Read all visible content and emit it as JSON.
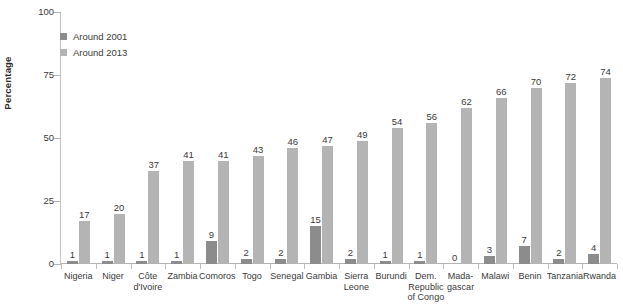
{
  "chart_data": {
    "type": "bar",
    "title": "",
    "xlabel": "",
    "ylabel": "Percentage",
    "ylim": [
      0,
      100
    ],
    "yticks": [
      0,
      25,
      50,
      75,
      100
    ],
    "grid": false,
    "legend_position": "top-left",
    "categories": [
      "Nigeria",
      "Niger",
      "Côte d'Ivoire",
      "Zambia",
      "Comoros",
      "Togo",
      "Senegal",
      "Gambia",
      "Sierra Leone",
      "Burundi",
      "Dem. Republic of Congo",
      "Madagascar",
      "Malawi",
      "Benin",
      "Tanzania",
      "Rwanda"
    ],
    "category_lines": [
      [
        "Nigeria"
      ],
      [
        "Niger"
      ],
      [
        "Côte",
        "d'Ivoire"
      ],
      [
        "Zambia"
      ],
      [
        "Comoros"
      ],
      [
        "Togo"
      ],
      [
        "Senegal"
      ],
      [
        "Gambia"
      ],
      [
        "Sierra",
        "Leone"
      ],
      [
        "Burundi"
      ],
      [
        "Dem.",
        "Republic",
        "of Congo"
      ],
      [
        "Mada-",
        "gascar"
      ],
      [
        "Malawi"
      ],
      [
        "Benin"
      ],
      [
        "Tanzania"
      ],
      [
        "Rwanda"
      ]
    ],
    "series": [
      {
        "name": "Around 2001",
        "color": "#8c8c8c",
        "values": [
          1,
          1,
          1,
          1,
          9,
          2,
          2,
          15,
          2,
          1,
          1,
          0,
          3,
          7,
          2,
          4
        ]
      },
      {
        "name": "Around 2013",
        "color": "#b4b4b4",
        "values": [
          17,
          20,
          37,
          41,
          41,
          43,
          46,
          47,
          49,
          54,
          56,
          62,
          66,
          70,
          72,
          74
        ]
      }
    ]
  },
  "legend": {
    "items": [
      {
        "label": "Around 2001",
        "color": "#8c8c8c"
      },
      {
        "label": "Around 2013",
        "color": "#b4b4b4"
      }
    ]
  }
}
